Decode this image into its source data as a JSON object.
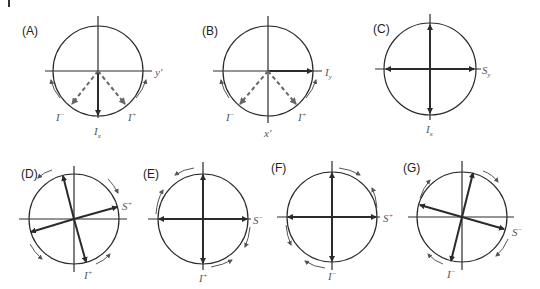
{
  "figure": {
    "panels": [
      {
        "id": "A",
        "label": "(A)",
        "axis_label": "y′",
        "vector_labels": [
          "I⁻",
          "I⁺",
          "Iₓ"
        ]
      },
      {
        "id": "B",
        "label": "(B)",
        "axis_label": "x′",
        "vector_labels": [
          "I⁻",
          "I⁺",
          "I_y"
        ]
      },
      {
        "id": "C",
        "label": "(C)",
        "vector_labels": [
          "S_y",
          "Iₓ"
        ]
      },
      {
        "id": "D",
        "label": "(D)",
        "vector_labels": [
          "S⁺",
          "I⁺"
        ]
      },
      {
        "id": "E",
        "label": "(E)",
        "vector_labels": [
          "S⁻",
          "I⁺"
        ]
      },
      {
        "id": "F",
        "label": "(F)",
        "vector_labels": [
          "S⁺",
          "I⁻"
        ]
      },
      {
        "id": "G",
        "label": "(G)",
        "vector_labels": [
          "S⁻",
          "I⁻"
        ]
      }
    ],
    "labels": {
      "A": {
        "panel": "(A)",
        "axis": "y",
        "axis_prime": "′",
        "i_minus": "I",
        "minus": "−",
        "i_plus": "I",
        "plus": "+",
        "ix": "I",
        "x": "x"
      },
      "B": {
        "panel": "(B)",
        "axis": "x",
        "axis_prime": "′",
        "i_minus": "I",
        "minus": "−",
        "i_plus": "I",
        "plus": "+",
        "iy": "I",
        "y": "y"
      },
      "C": {
        "panel": "(C)",
        "sy": "S",
        "y": "y",
        "ix": "I",
        "x": "x"
      },
      "D": {
        "panel": "(D)",
        "s": "S",
        "s_sign": "+",
        "i": "I",
        "i_sign": "+"
      },
      "E": {
        "panel": "(E)",
        "s": "S",
        "s_sign": "−",
        "i": "I",
        "i_sign": "+"
      },
      "F": {
        "panel": "(F)",
        "s": "S",
        "s_sign": "+",
        "i": "I",
        "i_sign": "−"
      },
      "G": {
        "panel": "(G)",
        "s": "S",
        "s_sign": "−",
        "i": "I",
        "i_sign": "−"
      }
    },
    "colors": {
      "line": "#2b2b2b",
      "dashed": "#666666",
      "label": "#555555"
    }
  }
}
